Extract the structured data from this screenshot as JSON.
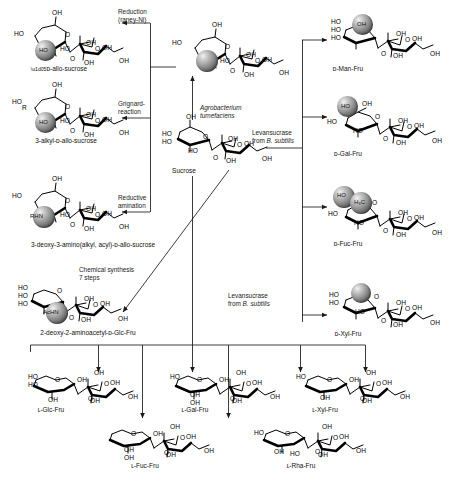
{
  "figure": {
    "type": "reaction-scheme",
    "start_material": "Sucrose"
  },
  "center": {
    "sucrose_label": "Sucrose",
    "allo_sucrose_label": "ᴅ-allo-sucrose"
  },
  "reactions": {
    "reduction": {
      "line1": "Reduction",
      "line2": "(raney-Ni)"
    },
    "grignard": {
      "line1": "Grignard-",
      "line2": "reaction"
    },
    "reductive_amination": {
      "line1": "Reductive",
      "line2": "amination"
    },
    "chemical_synthesis": {
      "line1": "Chemical synthesis",
      "line2": "7 steps"
    },
    "agrobacterium": {
      "line1": "Agrobacterium",
      "line2": "tumefaciens"
    },
    "levansucrase_top": {
      "line1": "Levansucrase",
      "line2_pre": "from ",
      "line2_it": "B. subtilis"
    },
    "levansucrase_bottom": {
      "line1": "Levansucrase",
      "line2_pre": "from ",
      "line2_it": "B. subtilis"
    }
  },
  "products": {
    "left": [
      {
        "id": "allo-sucrose",
        "label": "ᴅ-allo-sucrose"
      },
      {
        "id": "alkyl-allo",
        "label": "3-alkyl-ᴅ-allo-sucrose"
      },
      {
        "id": "amino-allo",
        "label": "3-deoxy-3-amino(alkyl, acyl)-ᴅ-allo-sucrose"
      },
      {
        "id": "aminoacetyl-glc",
        "label": "2-deoxy-2-aminoacetyl-ᴅ-Glc-Fru"
      }
    ],
    "right": [
      {
        "id": "man-fru",
        "label": "ᴅ-Man-Fru"
      },
      {
        "id": "gal-fru",
        "label": "ᴅ-Gal-Fru"
      },
      {
        "id": "fuc-fru",
        "label": "ᴅ-Fuc-Fru"
      },
      {
        "id": "xyl-fru",
        "label": "ᴅ-Xyl-Fru"
      }
    ],
    "bottom": [
      {
        "id": "l-glc-fru",
        "label": "ʟ-Glc-Fru"
      },
      {
        "id": "l-gal-fru",
        "label": "ʟ-Gal-Fru"
      },
      {
        "id": "l-xyl-fru",
        "label": "ʟ-Xyl-Fru"
      },
      {
        "id": "l-fuc-fru",
        "label": "ʟ-Fuc-Fru"
      },
      {
        "id": "l-rha-fru",
        "label": "ʟ-Rha-Fru"
      }
    ]
  },
  "atoms": {
    "OH": "OH",
    "HO": "HO",
    "O": "O",
    "R": "R",
    "RHN": "RHN",
    "AcHN": "AcHN",
    "HO_ball": "HO",
    "H3C": "H₃C"
  },
  "colors": {
    "ink": "#101010",
    "ball_dark": "#4a4a4a",
    "ball_light": "#f2f2f2",
    "background": "#ffffff"
  }
}
